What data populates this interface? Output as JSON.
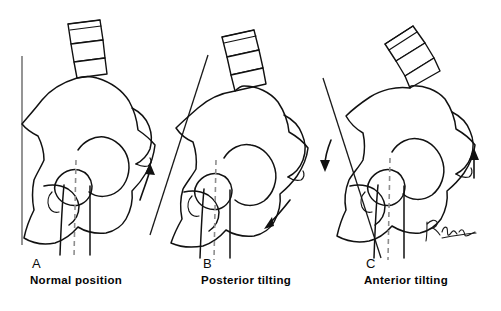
{
  "figure": {
    "background_color": "#ffffff",
    "ink_color": "#111111",
    "reference_line_color": "#7a7a7a",
    "dashed_axis_color": "#8e8e8e"
  },
  "panels": [
    {
      "letter": "A",
      "label": "Normal position",
      "reference_line": "vertical",
      "tilt_degrees": 0,
      "arrows": []
    },
    {
      "letter": "B",
      "label": "Posterior tilting",
      "reference_line": "tilted",
      "tilt_degrees": -17,
      "arrows": [
        {
          "name": "anterior-superior-iliac-spine-up-arrow",
          "direction": "up"
        },
        {
          "name": "ischial-tuberosity-down-arrow",
          "direction": "down-left"
        }
      ]
    },
    {
      "letter": "C",
      "label": "Anterior tilting",
      "reference_line": "tilted",
      "tilt_degrees": 14,
      "arrows": [
        {
          "name": "anterior-superior-iliac-spine-down-arrow",
          "direction": "down"
        },
        {
          "name": "ischial-tuberosity-up-arrow",
          "direction": "up"
        }
      ]
    }
  ],
  "signature": {
    "name": "artist-signature",
    "legible": false,
    "text": ""
  }
}
